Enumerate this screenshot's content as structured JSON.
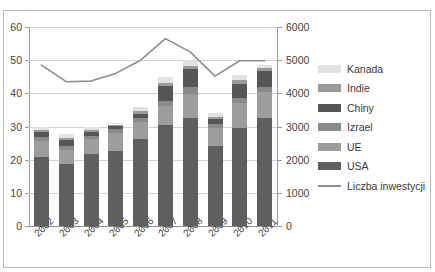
{
  "chart_data": {
    "type": "bar",
    "subtype": "stacked-bar-with-line-overlay",
    "title": "",
    "xlabel": "",
    "ylabel": "",
    "categories": [
      "2002",
      "2003",
      "2004",
      "2005",
      "2006",
      "2007",
      "2008",
      "2009",
      "2010",
      "2011"
    ],
    "axes": {
      "left": {
        "ylim": [
          0,
          60
        ],
        "ticks": [
          0,
          10,
          20,
          30,
          40,
          50,
          60
        ],
        "tick_labels": [
          "0",
          "10",
          "20",
          "30",
          "40",
          "50",
          "60"
        ]
      },
      "right": {
        "ylim": [
          0,
          6000
        ],
        "ticks": [
          0,
          1000,
          2000,
          3000,
          4000,
          5000,
          6000
        ],
        "tick_labels": [
          "0",
          "1000",
          "2000",
          "3000",
          "4000",
          "5000",
          "6000"
        ]
      }
    },
    "grid": true,
    "legend_position": "right",
    "stack_order_bottom_to_top": [
      "USA",
      "UE",
      "Izrael",
      "Chiny",
      "Indie",
      "Kanada"
    ],
    "series": [
      {
        "name": "USA",
        "axis": "left",
        "color": "#5f5f5f",
        "values": [
          20.7,
          18.8,
          21.6,
          22.6,
          26.1,
          30.4,
          32.7,
          24.1,
          29.5,
          32.7
        ]
      },
      {
        "name": "UE",
        "axis": "left",
        "color": "#9d9d9d",
        "values": [
          5.0,
          4.1,
          4.6,
          5.5,
          5.2,
          5.8,
          7.2,
          5.4,
          7.5,
          7.6
        ]
      },
      {
        "name": "Izrael",
        "axis": "left",
        "color": "#8a8a8a",
        "values": [
          1.2,
          1.1,
          1.0,
          1.1,
          1.3,
          1.5,
          2.0,
          1.3,
          1.6,
          1.6
        ]
      },
      {
        "name": "Chiny",
        "axis": "left",
        "color": "#565656",
        "values": [
          1.3,
          1.8,
          1.1,
          0.9,
          1.3,
          4.6,
          5.4,
          1.5,
          4.3,
          4.9
        ]
      },
      {
        "name": "Indie",
        "axis": "left",
        "color": "#9a9a9a",
        "values": [
          0.7,
          0.7,
          0.6,
          0.5,
          0.8,
          0.8,
          1.0,
          0.6,
          1.0,
          0.9
        ]
      },
      {
        "name": "Kanada",
        "axis": "left",
        "color": "#e2e2e2",
        "values": [
          1.1,
          1.3,
          1.1,
          0.4,
          1.1,
          1.9,
          1.7,
          1.1,
          1.6,
          0.8
        ]
      }
    ],
    "line_series": {
      "name": "Liczba inwestycji",
      "axis": "right",
      "color": "#8d8d8d",
      "values": [
        4850,
        4350,
        4370,
        4600,
        5000,
        5650,
        5250,
        4520,
        4980,
        4980
      ]
    }
  },
  "legend": {
    "items": [
      {
        "label": "Kanada",
        "color": "#e2e2e2",
        "type": "swatch"
      },
      {
        "label": "Indie",
        "color": "#9a9a9a",
        "type": "swatch"
      },
      {
        "label": "Chiny",
        "color": "#565656",
        "type": "swatch"
      },
      {
        "label": "Izrael",
        "color": "#8a8a8a",
        "type": "swatch"
      },
      {
        "label": "UE",
        "color": "#9d9d9d",
        "type": "swatch"
      },
      {
        "label": "USA",
        "color": "#5f5f5f",
        "type": "swatch"
      },
      {
        "label": "Liczba inwestycji",
        "color": "#8d8d8d",
        "type": "line"
      }
    ]
  }
}
